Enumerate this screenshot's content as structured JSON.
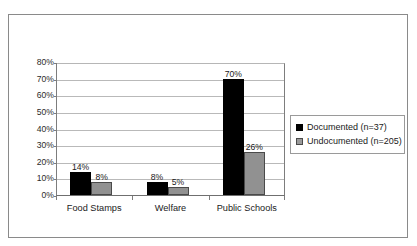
{
  "caption_sliver": "",
  "legend": {
    "position": "right",
    "entries": [
      {
        "label": "Documented (n=37)",
        "swatch": "documented-swatch",
        "color": "#000000"
      },
      {
        "label": "Undocumented (n=205)",
        "swatch": "undocumented-swatch",
        "color": "#919191"
      }
    ]
  },
  "chart_data": {
    "type": "bar",
    "title": "",
    "xlabel": "",
    "ylabel": "",
    "categories": [
      "Food Stamps",
      "Welfare",
      "Public Schools"
    ],
    "series": [
      {
        "name": "Documented (n=37)",
        "color": "#000000",
        "values": [
          14,
          8,
          70
        ]
      },
      {
        "name": "Undocumented (n=205)",
        "color": "#919191",
        "values": [
          8,
          5,
          26
        ]
      }
    ],
    "data_labels": [
      [
        "14%",
        "8%"
      ],
      [
        "8%",
        "5%"
      ],
      [
        "70%",
        "26%"
      ]
    ],
    "ylim": [
      0,
      80
    ],
    "yticks": [
      0,
      10,
      20,
      30,
      40,
      50,
      60,
      70,
      80
    ],
    "ytick_labels": [
      "0%",
      "10%",
      "20%",
      "30%",
      "40%",
      "50%",
      "60%",
      "70%",
      "80%"
    ],
    "grid": true,
    "legend_position": "right"
  }
}
